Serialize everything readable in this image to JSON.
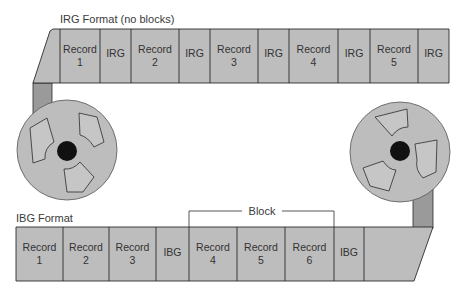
{
  "colors": {
    "tape": "#bdbdbd",
    "connector": "#9a9a9a",
    "reel": "#bdbdbd",
    "hub": "#111111",
    "line": "#2b2b2b",
    "background": "#ffffff"
  },
  "irg_format": {
    "title": "IRG Format (no blocks)",
    "cells": [
      {
        "line1": "Record",
        "line2": "1"
      },
      {
        "line1": "IRG",
        "line2": ""
      },
      {
        "line1": "Record",
        "line2": "2"
      },
      {
        "line1": "IRG",
        "line2": ""
      },
      {
        "line1": "Record",
        "line2": "3"
      },
      {
        "line1": "IRG",
        "line2": ""
      },
      {
        "line1": "Record",
        "line2": "4"
      },
      {
        "line1": "IRG",
        "line2": ""
      },
      {
        "line1": "Record",
        "line2": "5"
      },
      {
        "line1": "IRG",
        "line2": ""
      }
    ]
  },
  "ibg_format": {
    "title": "IBG Format",
    "block_label": "Block",
    "cells": [
      {
        "line1": "Record",
        "line2": "1"
      },
      {
        "line1": "Record",
        "line2": "2"
      },
      {
        "line1": "Record",
        "line2": "3"
      },
      {
        "line1": "IBG",
        "line2": ""
      },
      {
        "line1": "Record",
        "line2": "4"
      },
      {
        "line1": "Record",
        "line2": "5"
      },
      {
        "line1": "Record",
        "line2": "6"
      },
      {
        "line1": "IBG",
        "line2": ""
      }
    ]
  },
  "reels": [
    {
      "name": "left-reel"
    },
    {
      "name": "right-reel"
    }
  ]
}
